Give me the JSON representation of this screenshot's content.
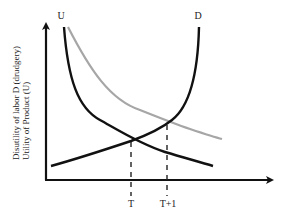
{
  "diagram": {
    "top_caption_partial": "",
    "y_axis_label_line1": "Disutility of labor D (drudgery)",
    "y_axis_label_line2": "Utility of Product (U)",
    "curve_labels": {
      "U": "U",
      "D": "D"
    },
    "x_ticks": {
      "T": "T",
      "T_plus_1": "T+1"
    },
    "colors": {
      "axis": "#111111",
      "utility_curve": "#111111",
      "disutility_curve": "#111111",
      "shifted_utility_curve": "#a6a6a6",
      "guide_lines": "#222222"
    },
    "curves": [
      {
        "name": "U",
        "description": "Utility of product, decreasing",
        "color": "black"
      },
      {
        "name": "U-shifted",
        "description": "Shifted utility curve, decreasing",
        "color": "grey"
      },
      {
        "name": "D",
        "description": "Disutility of labor, increasing",
        "color": "black"
      }
    ]
  }
}
